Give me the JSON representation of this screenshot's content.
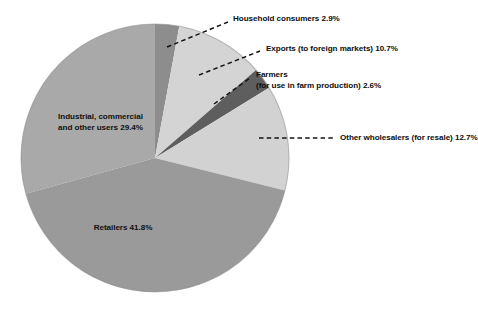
{
  "chart_data": {
    "type": "pie",
    "title": "",
    "subtitle": "",
    "xlabel": "",
    "ylabel": "",
    "legend_position": "none",
    "grid": false,
    "units": "percent",
    "total": 100.1,
    "categories": [
      "Household consumers",
      "Exports (to foreign markets)",
      "Farmers (for use in farm production)",
      "Other wholesalers (for resale)",
      "Retailers",
      "Industrial, commercial and other users"
    ],
    "values": [
      2.9,
      10.7,
      2.6,
      12.7,
      41.8,
      29.4
    ],
    "colors": [
      "#8d8d8d",
      "#d2d2d2",
      "#5e5e5e",
      "#d2d2d2",
      "#9a9a9a",
      "#a8a8a8"
    ],
    "slices": [
      {
        "name": "household-consumers",
        "label": "Household consumers 2.9%",
        "value": 2.9,
        "color": "#8d8d8d",
        "start_angle": 0,
        "end_angle": 10.44,
        "label_placement": "external"
      },
      {
        "name": "exports",
        "label": "Exports (to foreign markets) 10.7%",
        "value": 10.7,
        "color": "#d4d4d4",
        "start_angle": 10.44,
        "end_angle": 48.96,
        "label_placement": "external"
      },
      {
        "name": "farmers",
        "label_line1": "Farmers",
        "label_line2": "(for use in farm production)  2.6%",
        "value": 2.6,
        "color": "#5e5e5e",
        "start_angle": 48.96,
        "end_angle": 58.32,
        "label_placement": "external"
      },
      {
        "name": "other-wholesalers",
        "label": "Other wholesalers (for resale) 12.7%",
        "value": 12.7,
        "color": "#d2d2d2",
        "start_angle": 58.32,
        "end_angle": 104.04,
        "label_placement": "external"
      },
      {
        "name": "retailers",
        "label": "Retailers 41.8%",
        "value": 41.8,
        "color": "#9a9a9a",
        "start_angle": 104.04,
        "end_angle": 254.52,
        "label_placement": "internal"
      },
      {
        "name": "industrial-commercial",
        "label_line1": "Industrial, commercial",
        "label_line2": "and other users 29.4%",
        "value": 29.4,
        "color": "#a9a9a9",
        "start_angle": 254.52,
        "end_angle": 360,
        "label_placement": "internal"
      }
    ]
  },
  "labels": {
    "household": "Household consumers 2.9%",
    "exports": "Exports (to foreign markets) 10.7%",
    "farmers_line1": "Farmers",
    "farmers_line2": "(for use in farm production)  2.6%",
    "wholesalers": "Other wholesalers (for resale) 12.7%",
    "retailers": "Retailers 41.8%",
    "industrial_line1": "Industrial, commercial",
    "industrial_line2": "and other users 29.4%"
  },
  "page": {
    "cropped_text_top": "",
    "background": "#ffffff"
  }
}
